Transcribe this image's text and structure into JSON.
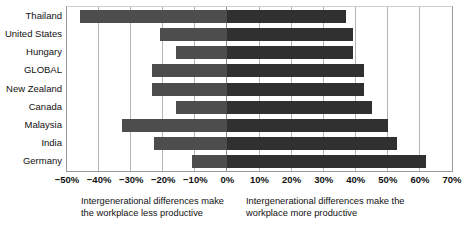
{
  "chart_data": {
    "type": "bar",
    "orientation": "horizontal-diverging",
    "title": "",
    "subtitle": "",
    "xlabel": "",
    "ylabel": "",
    "xlim": [
      -50,
      70
    ],
    "xtick_step": 10,
    "grid": true,
    "legend_position": "below-axis-captions",
    "axis_unit": "%",
    "categories": [
      "Thailand",
      "United States",
      "Hungary",
      "GLOBAL",
      "New Zealand",
      "Canada",
      "Malaysia",
      "India",
      "Germany"
    ],
    "series": [
      {
        "name": "Intergenerational differences make the workplace less productive",
        "color": "#4d4d4d",
        "values": [
          -46,
          -21,
          -16,
          -23.5,
          -23.5,
          -16,
          -33,
          -23,
          -11
        ]
      },
      {
        "name": "Intergenerational differences make the workplace more productive",
        "color": "#303030",
        "values": [
          37,
          39,
          39,
          42.5,
          42.5,
          45,
          50,
          53,
          62
        ]
      }
    ],
    "xticks": [
      -50,
      -40,
      -30,
      -20,
      -10,
      0,
      10,
      20,
      30,
      40,
      50,
      60,
      70
    ],
    "xtick_labels": [
      "−50%",
      "−40%",
      "−30%",
      "−20%",
      "−10%",
      "0%",
      "10%",
      "20%",
      "30%",
      "40%",
      "50%",
      "60%",
      "70%"
    ]
  },
  "captions": {
    "left": "Intergenerational differences make the workplace less productive",
    "right": "Intergenerational differences make the workplace more productive"
  },
  "colors": {
    "negative_bar": "#4d4d4d",
    "positive_bar": "#303030",
    "gridline": "#b4b4b4",
    "axis": "#9a9a9a",
    "background": "#ffffff",
    "text": "#111111"
  }
}
